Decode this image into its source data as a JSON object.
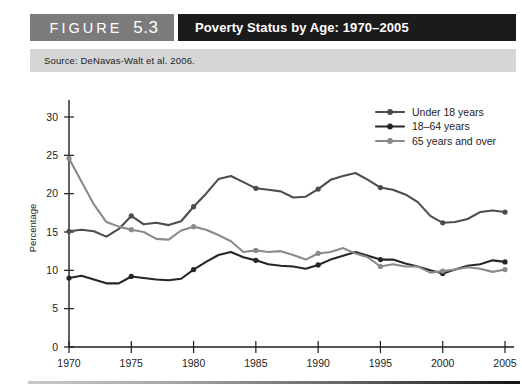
{
  "header": {
    "figure_word": "FIGURE",
    "figure_number": "5.3",
    "title": "Poverty Status by Age: 1970–2005",
    "tag_bg": "#7b7b7b",
    "title_bg": "#1b1b1b"
  },
  "source": {
    "text": "Source: DeNavas-Walt et al. 2006."
  },
  "chart_data": {
    "type": "line",
    "title": "Poverty Status by Age: 1970–2005",
    "xlabel": "",
    "ylabel": "Percentage",
    "xlim": [
      1970,
      2005
    ],
    "ylim": [
      0,
      30
    ],
    "yticks": [
      0,
      5,
      10,
      15,
      20,
      25,
      30
    ],
    "xticks": [
      1970,
      1975,
      1980,
      1985,
      1990,
      1995,
      2000,
      2005
    ],
    "ytick_labels": [
      "0",
      "5",
      "10",
      "15",
      "20",
      "25",
      "30"
    ],
    "xtick_labels": [
      "1970",
      "1975",
      "1980",
      "1985",
      "1990",
      "1995",
      "2000",
      "2005"
    ],
    "grid": false,
    "legend_position": "top-right",
    "marker_years": [
      1970,
      1975,
      1980,
      1985,
      1990,
      1995,
      2000,
      2005
    ],
    "x": [
      1970,
      1971,
      1972,
      1973,
      1974,
      1975,
      1976,
      1977,
      1978,
      1979,
      1980,
      1981,
      1982,
      1983,
      1984,
      1985,
      1986,
      1987,
      1988,
      1989,
      1990,
      1991,
      1992,
      1993,
      1994,
      1995,
      1996,
      1997,
      1998,
      1999,
      2000,
      2001,
      2002,
      2003,
      2004,
      2005
    ],
    "series": [
      {
        "name": "Under 18 years",
        "color": "#4d4d4d",
        "values": [
          15.1,
          15.3,
          15.1,
          14.4,
          15.4,
          17.1,
          16.0,
          16.2,
          15.9,
          16.4,
          18.3,
          20.0,
          21.9,
          22.3,
          21.5,
          20.7,
          20.5,
          20.3,
          19.5,
          19.6,
          20.6,
          21.8,
          22.3,
          22.7,
          21.8,
          20.8,
          20.5,
          19.9,
          18.9,
          17.1,
          16.2,
          16.3,
          16.7,
          17.6,
          17.8,
          17.6
        ]
      },
      {
        "name": "18–64 years",
        "color": "#262626",
        "values": [
          9.0,
          9.3,
          8.8,
          8.3,
          8.3,
          9.2,
          9.0,
          8.8,
          8.7,
          8.9,
          10.1,
          11.1,
          12.0,
          12.4,
          11.7,
          11.3,
          10.8,
          10.6,
          10.5,
          10.2,
          10.7,
          11.4,
          11.9,
          12.4,
          11.9,
          11.4,
          11.4,
          10.9,
          10.5,
          10.0,
          9.6,
          10.1,
          10.6,
          10.8,
          11.3,
          11.1
        ]
      },
      {
        "name": "65 years and over",
        "color": "#8a8a8a",
        "values": [
          24.6,
          21.6,
          18.6,
          16.3,
          15.7,
          15.3,
          15.0,
          14.1,
          14.0,
          15.2,
          15.7,
          15.3,
          14.6,
          13.8,
          12.4,
          12.6,
          12.4,
          12.5,
          12.0,
          11.4,
          12.2,
          12.4,
          12.9,
          12.2,
          11.7,
          10.5,
          10.8,
          10.5,
          10.5,
          9.7,
          9.9,
          10.1,
          10.4,
          10.2,
          9.8,
          10.1
        ]
      }
    ],
    "endpoint_values": {
      "1970": {
        "Under 18 years": 15.1,
        "18–64 years": 9.0,
        "65 years and over": 24.6
      },
      "2005": {
        "Under 18 years": 17.6,
        "18–64 years": 11.1,
        "65 years and over": 10.1
      }
    }
  },
  "legend": {
    "items": [
      {
        "label": "Under 18 years",
        "color": "#4d4d4d"
      },
      {
        "label": "18–64 years",
        "color": "#262626"
      },
      {
        "label": "65 years and over",
        "color": "#8a8a8a"
      }
    ]
  },
  "axis": {
    "y_title": "Percentage",
    "axis_color": "#1d1d1d"
  }
}
